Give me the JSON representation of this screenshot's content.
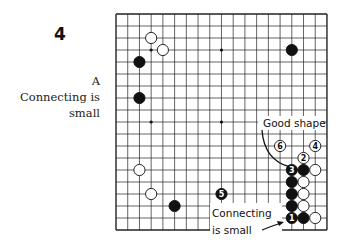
{
  "figure": {
    "number": "4",
    "caption_letter": "A",
    "caption_lines": [
      "Connecting is",
      "small"
    ]
  },
  "board": {
    "size": 19,
    "origin": [
      116,
      14
    ],
    "spacing": [
      11.72,
      12.0
    ],
    "star_points": [
      [
        3,
        3
      ],
      [
        9,
        3
      ],
      [
        15,
        3
      ],
      [
        3,
        9
      ],
      [
        9,
        9
      ],
      [
        15,
        9
      ],
      [
        3,
        15
      ],
      [
        9,
        15
      ],
      [
        15,
        15
      ]
    ],
    "stones": [
      {
        "col": 3,
        "row": 2,
        "color": "white"
      },
      {
        "col": 4,
        "row": 3,
        "color": "white"
      },
      {
        "col": 2,
        "row": 4,
        "color": "black"
      },
      {
        "col": 2,
        "row": 7,
        "color": "black"
      },
      {
        "col": 15,
        "row": 3,
        "color": "black"
      },
      {
        "col": 2,
        "row": 13,
        "color": "white"
      },
      {
        "col": 3,
        "row": 15,
        "color": "white"
      },
      {
        "col": 5,
        "row": 16,
        "color": "black"
      },
      {
        "col": 16,
        "row": 13,
        "color": "black"
      },
      {
        "col": 17,
        "row": 13,
        "color": "white"
      },
      {
        "col": 15,
        "row": 14,
        "color": "black"
      },
      {
        "col": 16,
        "row": 14,
        "color": "white"
      },
      {
        "col": 15,
        "row": 15,
        "color": "black"
      },
      {
        "col": 16,
        "row": 15,
        "color": "white"
      },
      {
        "col": 15,
        "row": 16,
        "color": "black"
      },
      {
        "col": 16,
        "row": 16,
        "color": "white"
      },
      {
        "col": 16,
        "row": 17,
        "color": "black"
      },
      {
        "col": 17,
        "row": 17,
        "color": "white"
      }
    ],
    "numbered_moves": [
      {
        "n": "1",
        "col": 15,
        "row": 17,
        "color": "black"
      },
      {
        "n": "2",
        "col": 16,
        "row": 12,
        "color": "white"
      },
      {
        "n": "3",
        "col": 15,
        "row": 13,
        "color": "black"
      },
      {
        "n": "4",
        "col": 17,
        "row": 11,
        "color": "white"
      },
      {
        "n": "5",
        "col": 9,
        "row": 15,
        "color": "black"
      },
      {
        "n": "6",
        "col": 14,
        "row": 11,
        "color": "white"
      }
    ],
    "annotations": [
      {
        "id": "good-shape",
        "text": "Good shape"
      },
      {
        "id": "connecting-small-1",
        "text": "Connecting"
      },
      {
        "id": "connecting-small-2",
        "text": "is small"
      }
    ]
  }
}
